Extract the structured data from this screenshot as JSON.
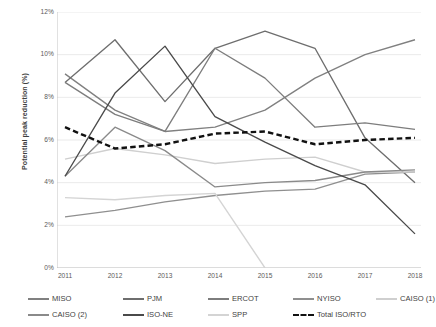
{
  "chart_data": {
    "type": "line",
    "title": "",
    "xlabel": "",
    "ylabel": "Potential peak reduction (%)",
    "categories": [
      "2011",
      "2012",
      "2013",
      "2014",
      "2015",
      "2016",
      "2017",
      "2018"
    ],
    "x": [
      2011,
      2012,
      2013,
      2014,
      2015,
      2016,
      2017,
      2018
    ],
    "ylim": [
      0,
      12
    ],
    "yticks": [
      "0%",
      "2%",
      "4%",
      "6%",
      "8%",
      "10%",
      "12%"
    ],
    "ytick_values": [
      0,
      2,
      4,
      6,
      8,
      10,
      12
    ],
    "grid": "horizontal",
    "legend_position": "bottom",
    "series": [
      {
        "name": "MISO",
        "color": "#808080",
        "style": "solid",
        "values": [
          9.1,
          7.4,
          6.4,
          6.6,
          7.4,
          8.9,
          10.0,
          10.7
        ]
      },
      {
        "name": "PJM",
        "color": "#6e6e6e",
        "style": "solid",
        "values": [
          8.7,
          10.7,
          7.8,
          10.3,
          11.1,
          10.3,
          6.1,
          4.0
        ]
      },
      {
        "name": "ERCOT",
        "color": "#7d7d7d",
        "style": "solid",
        "values": [
          8.7,
          7.2,
          6.4,
          10.3,
          8.9,
          6.6,
          6.8,
          6.5
        ]
      },
      {
        "name": "NYISO",
        "color": "#8f8f8f",
        "style": "solid",
        "values": [
          2.4,
          2.7,
          3.1,
          3.4,
          3.6,
          3.7,
          4.4,
          4.5
        ]
      },
      {
        "name": "CAISO (1)",
        "color": "#cfcfcf",
        "style": "solid",
        "values": [
          5.1,
          5.6,
          5.3,
          4.9,
          5.1,
          5.2,
          4.5,
          4.5
        ]
      },
      {
        "name": "CAISO (2)",
        "color": "#8a8a8a",
        "style": "solid",
        "values": [
          4.3,
          6.6,
          5.5,
          3.8,
          4.0,
          4.1,
          4.5,
          4.6
        ]
      },
      {
        "name": "ISO-NE",
        "color": "#4a4a4a",
        "style": "solid",
        "values": [
          4.3,
          8.2,
          10.4,
          7.1,
          5.9,
          4.8,
          3.9,
          1.6
        ]
      },
      {
        "name": "SPP",
        "color": "#d4d4d4",
        "style": "solid",
        "values": [
          3.3,
          3.2,
          3.4,
          3.5,
          0.0,
          null,
          null,
          null
        ]
      },
      {
        "name": "Total ISO/RTO",
        "color": "#111111",
        "style": "dashed",
        "values": [
          6.6,
          5.6,
          5.8,
          6.3,
          6.4,
          5.8,
          6.0,
          6.1
        ]
      }
    ],
    "annotations": []
  },
  "axes": {
    "y_title": "Potential peak reduction (%)",
    "y_ticks": [
      "12%",
      "10%",
      "8%",
      "6%",
      "4%",
      "2%",
      "0%"
    ],
    "x_ticks": [
      "2011",
      "2012",
      "2013",
      "2014",
      "2015",
      "2016",
      "2017",
      "2018"
    ]
  },
  "legend": {
    "row1": [
      {
        "label": "MISO",
        "color": "#808080",
        "style": "solid"
      },
      {
        "label": "PJM",
        "color": "#6e6e6e",
        "style": "solid"
      },
      {
        "label": "ERCOT",
        "color": "#7d7d7d",
        "style": "solid"
      },
      {
        "label": "NYISO",
        "color": "#8f8f8f",
        "style": "solid"
      },
      {
        "label": "CAISO (1)",
        "color": "#cfcfcf",
        "style": "solid"
      }
    ],
    "row2": [
      {
        "label": "CAISO (2)",
        "color": "#8a8a8a",
        "style": "solid"
      },
      {
        "label": "ISO-NE",
        "color": "#4a4a4a",
        "style": "solid"
      },
      {
        "label": "SPP",
        "color": "#d4d4d4",
        "style": "solid"
      },
      {
        "label": "Total ISO/RTO",
        "color": "#111111",
        "style": "dashed"
      }
    ]
  }
}
